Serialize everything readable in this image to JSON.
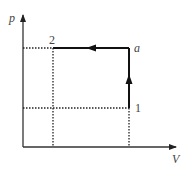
{
  "diagram": {
    "type": "pV-diagram",
    "axes": {
      "y_label": "p",
      "x_label": "V"
    },
    "points": [
      {
        "id": "2",
        "label": "2",
        "x": 53,
        "y": 48
      },
      {
        "id": "a",
        "label": "a",
        "x": 129,
        "y": 48
      },
      {
        "id": "1",
        "label": "1",
        "x": 129,
        "y": 108
      }
    ],
    "processes": [
      {
        "from": "1",
        "to": "a",
        "kind": "isochoric",
        "direction": "up"
      },
      {
        "from": "a",
        "to": "2",
        "kind": "isobaric",
        "direction": "left"
      }
    ],
    "guide_lines": "dotted projections to axes",
    "colors": {
      "line": "#111111",
      "axis": "#333333",
      "dotted": "#222222",
      "text": "#444444"
    }
  }
}
